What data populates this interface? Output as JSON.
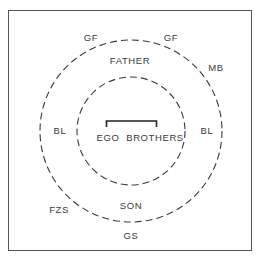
{
  "diagram": {
    "type": "concentric-kinship-circles",
    "colors": {
      "line": "#3a3a3a",
      "frame": "#555555",
      "background": "#ffffff"
    },
    "circles": [
      {
        "id": "inner",
        "cx": 131,
        "cy": 131,
        "r": 54,
        "style": "dashed"
      },
      {
        "id": "outer",
        "cx": 131,
        "cy": 131,
        "r": 91,
        "style": "dashed"
      }
    ],
    "bracket": {
      "from": "EGO",
      "to": "BROTHERS"
    },
    "labels": {
      "gf_left": "GF",
      "gf_right": "GF",
      "father": "FATHER",
      "mb": "MB",
      "bl_left": "BL",
      "bl_right": "BL",
      "ego": "EGO",
      "brothers": "BROTHERS",
      "fzs": "FZS",
      "son": "SON",
      "gs": "GS"
    }
  }
}
